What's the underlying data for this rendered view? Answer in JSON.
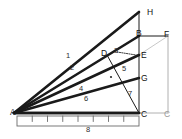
{
  "figure": {
    "background_color": "#ffffff",
    "stroke_color": "#1a1a1a",
    "thin_stroke_color": "#555555",
    "faint_stroke_color": "#b0b0b0",
    "width": 182,
    "height": 139
  },
  "points": [
    {
      "id": "A",
      "label": "A",
      "x": 14,
      "y": 113,
      "label_x": 10,
      "label_y": 108
    },
    {
      "id": "B",
      "label": "B",
      "x": 139,
      "y": 36,
      "label_x": 136,
      "label_y": 29
    },
    {
      "id": "C",
      "label": "C",
      "x": 139,
      "y": 113,
      "label_x": 141,
      "label_y": 110
    },
    {
      "id": "D",
      "label": "D",
      "x": 107,
      "y": 55,
      "label_x": 101,
      "label_y": 49
    },
    {
      "id": "E",
      "label": "E",
      "x": 139,
      "y": 55,
      "label_x": 141,
      "label_y": 51
    },
    {
      "id": "F",
      "label": "F",
      "x": 168,
      "y": 36,
      "label_x": 164,
      "label_y": 30
    },
    {
      "id": "G",
      "label": "G",
      "x": 139,
      "y": 78,
      "label_x": 141,
      "label_y": 74
    },
    {
      "id": "H",
      "label": "H",
      "x": 139,
      "y": 12,
      "label_x": 147,
      "label_y": 8
    },
    {
      "id": "C2",
      "label": "C",
      "x": 168,
      "y": 113,
      "label_x": 164,
      "label_y": 110
    }
  ],
  "rays": [
    {
      "name": "ray-A-H",
      "from": "A",
      "to": "H",
      "width": 2.6
    },
    {
      "name": "ray-A-B",
      "from": "A",
      "to": "B",
      "width": 2.6
    },
    {
      "name": "ray-A-E",
      "from": "A",
      "to": "E",
      "width": 2.6
    },
    {
      "name": "ray-A-G",
      "from": "A",
      "to": "G",
      "width": 2.6
    },
    {
      "name": "ray-A-C",
      "from": "A",
      "to": "C",
      "width": 2.6
    }
  ],
  "segments": [
    {
      "name": "segment-D-C",
      "from": "D",
      "to": "C",
      "width": 1.0,
      "style": "solid"
    },
    {
      "name": "segment-B-H",
      "from": "B",
      "to": "H",
      "width": 1.0,
      "style": "solid"
    },
    {
      "name": "segment-B-C",
      "from": "B",
      "to": "C",
      "width": 1.0,
      "style": "solid"
    },
    {
      "name": "segment-B-F",
      "from": "B",
      "to": "F",
      "width": 1.0,
      "style": "solid"
    },
    {
      "name": "segment-F-C2",
      "from": "F",
      "to": "C2",
      "width": 1.0,
      "style": "solid-faint"
    },
    {
      "name": "segment-C-C2",
      "from": "C",
      "to": "C2",
      "width": 1.0,
      "style": "solid-faint"
    },
    {
      "name": "segment-E-F",
      "from": "E",
      "to": "F",
      "width": 0.7,
      "style": "thin-faint"
    }
  ],
  "dotted_segments": [
    {
      "name": "dotted-segment-to-E",
      "x1": 117,
      "y1": 52,
      "x2": 136,
      "y2": 55,
      "width": 1.0
    }
  ],
  "number_labels": [
    {
      "name": "angle-number-1",
      "text": "1",
      "x": 66,
      "y": 52
    },
    {
      "name": "angle-number-2",
      "text": "2",
      "x": 70,
      "y": 64
    },
    {
      "name": "angle-number-3",
      "text": "3",
      "x": 114,
      "y": 47
    },
    {
      "name": "angle-number-4",
      "text": "4",
      "x": 79,
      "y": 85
    },
    {
      "name": "angle-number-5",
      "text": "5",
      "x": 122,
      "y": 65
    },
    {
      "name": "angle-number-6",
      "text": "6",
      "x": 84,
      "y": 95
    },
    {
      "name": "angle-number-7",
      "text": "7",
      "x": 128,
      "y": 90
    },
    {
      "name": "ruler-number-8",
      "text": "8",
      "x": 86,
      "y": 126
    }
  ],
  "tick_dot": {
    "name": "interior-dot",
    "x": 111,
    "y": 77,
    "r": 1.1
  },
  "ruler": {
    "name": "ruler",
    "x": 17,
    "y": 116,
    "width": 122,
    "height": 10,
    "divisions": 8,
    "label": "8",
    "border_color": "#6a6a6a"
  },
  "baseline": {
    "name": "baseline-A-C",
    "x1": 14,
    "y1": 113,
    "x2": 139,
    "y2": 113
  }
}
